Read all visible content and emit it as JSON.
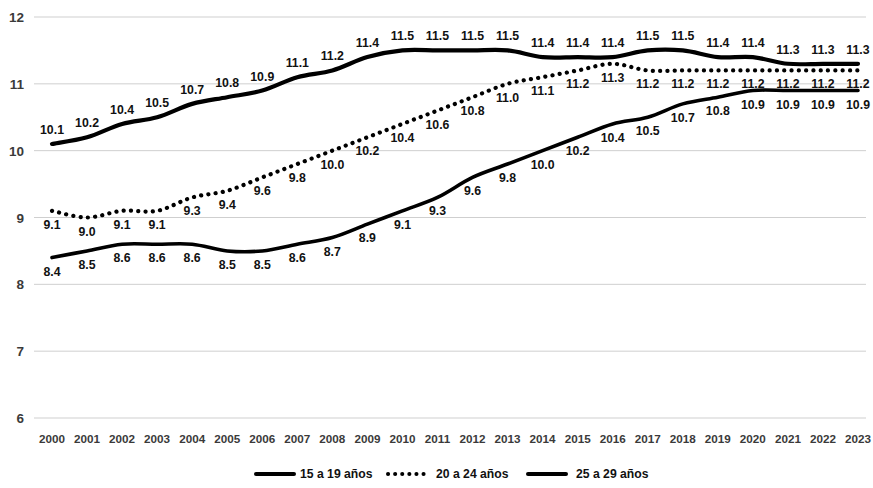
{
  "chart_data": {
    "type": "line",
    "title": "",
    "subtitle": "",
    "xlabel": "",
    "ylabel": "",
    "ylim": [
      6,
      12
    ],
    "yticks": [
      6,
      7,
      8,
      9,
      10,
      11,
      12
    ],
    "grid": true,
    "legend_position": "bottom",
    "categories": [
      "2000",
      "2001",
      "2002",
      "2003",
      "2004",
      "2005",
      "2006",
      "2007",
      "2008",
      "2009",
      "2010",
      "2011",
      "2012",
      "2013",
      "2014",
      "2015",
      "2016",
      "2017",
      "2018",
      "2019",
      "2020",
      "2021",
      "2022",
      "2023"
    ],
    "series": [
      {
        "name": "15 a 19 años",
        "style": "solid",
        "color": "#000000",
        "label_position": "above",
        "values": [
          10.1,
          10.2,
          10.4,
          10.5,
          10.7,
          10.8,
          10.9,
          11.1,
          11.2,
          11.4,
          11.5,
          11.5,
          11.5,
          11.5,
          11.4,
          11.4,
          11.4,
          11.5,
          11.5,
          11.4,
          11.4,
          11.3,
          11.3,
          11.3
        ],
        "labels": [
          "10.1",
          "10.2",
          "10.4",
          "10.5",
          "10.7",
          "10.8",
          "10.9",
          "11.1",
          "11.2",
          "11.4",
          "11.5",
          "11.5",
          "11.5",
          "11.5",
          "11.4",
          "11.4",
          "11.4",
          "11.5",
          "11.5",
          "11.4",
          "11.4",
          "11.3",
          "11.3",
          "11.3"
        ]
      },
      {
        "name": "20 a 24 años",
        "style": "dotted",
        "color": "#000000",
        "label_position": "below",
        "values": [
          9.1,
          9.0,
          9.1,
          9.1,
          9.3,
          9.4,
          9.6,
          9.8,
          10.0,
          10.2,
          10.4,
          10.6,
          10.8,
          11.0,
          11.1,
          11.2,
          11.3,
          11.2,
          11.2,
          11.2,
          11.2,
          11.2,
          11.2,
          11.2
        ],
        "labels": [
          "9.1",
          "9.0",
          "9.1",
          "9.1",
          "9.3",
          "9.4",
          "9.6",
          "9.8",
          "10.0",
          "10.2",
          "10.4",
          "10.6",
          "10.8",
          "11.0",
          "11.1",
          "11.2",
          "11.3",
          "11.2",
          "11.2",
          "11.2",
          "11.2",
          "11.2",
          "11.2",
          "11.2"
        ]
      },
      {
        "name": "25 a 29 años",
        "style": "solid",
        "color": "#000000",
        "label_position": "below",
        "values": [
          8.4,
          8.5,
          8.6,
          8.6,
          8.6,
          8.5,
          8.5,
          8.6,
          8.7,
          8.9,
          9.1,
          9.3,
          9.6,
          9.8,
          10.0,
          10.2,
          10.4,
          10.5,
          10.7,
          10.8,
          10.9,
          10.9,
          10.9,
          10.9
        ],
        "labels": [
          "8.4",
          "8.5",
          "8.6",
          "8.6",
          "8.6",
          "8.5",
          "8.5",
          "8.6",
          "8.7",
          "8.9",
          "9.1",
          "9.3",
          "9.6",
          "9.8",
          "10.0",
          "10.2",
          "10.4",
          "10.5",
          "10.7",
          "10.8",
          "10.9",
          "10.9",
          "10.9",
          "10.9"
        ]
      }
    ]
  },
  "legend": {
    "items": [
      {
        "label": "15 a 19 años",
        "marker": "solid-line"
      },
      {
        "label": "20 a 24 años",
        "marker": "dotted-line"
      },
      {
        "label": "25 a 29 años",
        "marker": "solid-line"
      }
    ]
  }
}
